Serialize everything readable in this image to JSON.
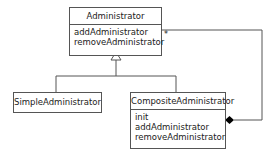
{
  "diagram": {
    "type": "UML class diagram",
    "classes": [
      {
        "name": "Administrator",
        "operations": [
          "addAdministrator",
          "removeAdministrator"
        ]
      },
      {
        "name": "SimpleAdministrator",
        "operations": []
      },
      {
        "name": "CompositeAdministrator",
        "operations": [
          "init",
          "addAdministrator",
          "removeAdministrator"
        ]
      }
    ],
    "relationships": [
      {
        "type": "generalization",
        "from": "SimpleAdministrator",
        "to": "Administrator"
      },
      {
        "type": "generalization",
        "from": "CompositeAdministrator",
        "to": "Administrator"
      },
      {
        "type": "composition",
        "whole": "CompositeAdministrator",
        "part": "Administrator",
        "multiplicity": "*"
      }
    ],
    "colors": {
      "line": "#555555",
      "background": "#ffffff"
    }
  }
}
